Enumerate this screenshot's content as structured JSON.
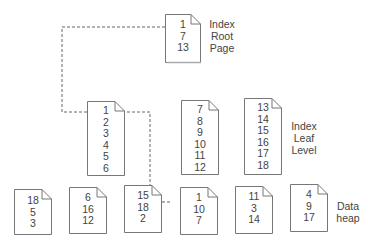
{
  "labels": {
    "root": [
      "Index",
      "Root",
      "Page"
    ],
    "leaf": [
      "Index",
      "Leaf",
      "Level"
    ],
    "heap": [
      "Data",
      "heap"
    ]
  },
  "root_page": {
    "values": [
      "1",
      "7",
      "13"
    ]
  },
  "leaf_pages": [
    {
      "values": [
        "1",
        "2",
        "3",
        "4",
        "5",
        "6"
      ]
    },
    {
      "values": [
        "7",
        "8",
        "9",
        "10",
        "11",
        "12"
      ]
    },
    {
      "values": [
        "13",
        "14",
        "15",
        "16",
        "17",
        "18"
      ]
    }
  ],
  "heap_pages": [
    {
      "values": [
        "18",
        "5",
        "3"
      ]
    },
    {
      "values": [
        "6",
        "16",
        "12"
      ]
    },
    {
      "values": [
        "15",
        "18",
        "2"
      ]
    },
    {
      "values": [
        "1",
        "10",
        "7"
      ]
    },
    {
      "values": [
        "11",
        "3",
        "14"
      ]
    },
    {
      "values": [
        "4",
        "9",
        "17"
      ]
    }
  ]
}
